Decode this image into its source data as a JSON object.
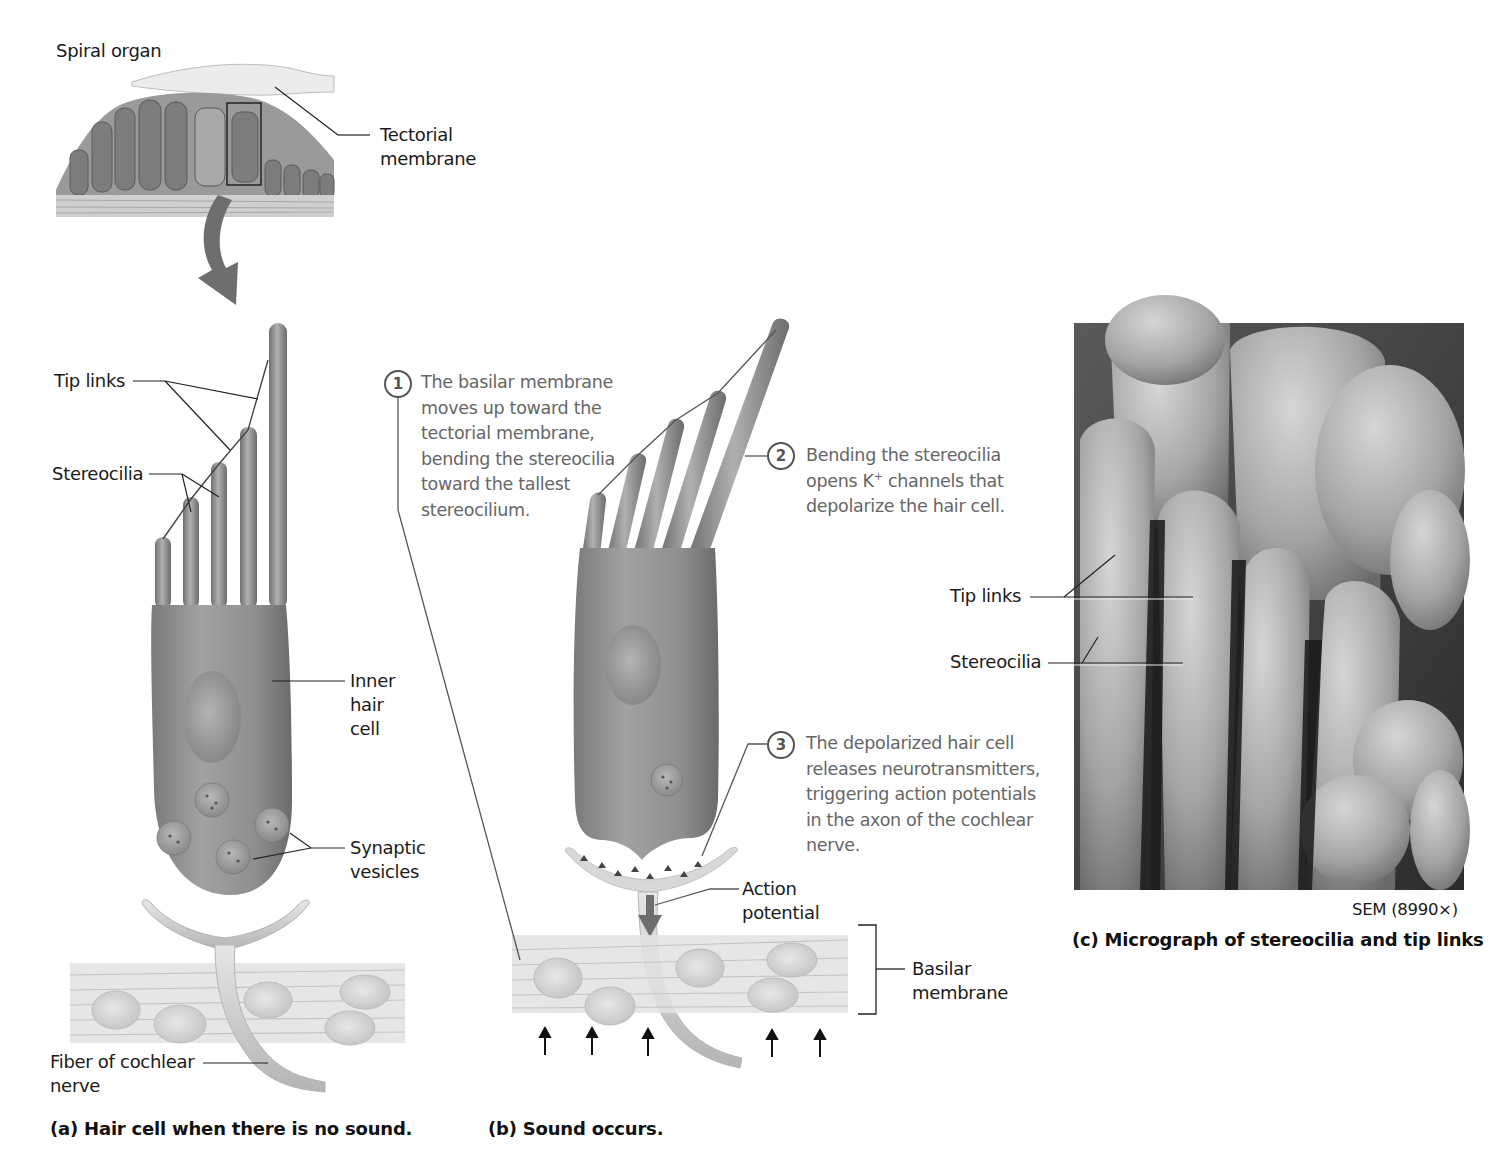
{
  "figure": {
    "inset": {
      "title": "Spiral organ",
      "tectorial_label_line1": "Tectorial",
      "tectorial_label_line2": "membrane"
    },
    "panel_a": {
      "tip_links_label": "Tip links",
      "stereocilia_label": "Stereocilia",
      "inner_hair_cell_line1": "Inner",
      "inner_hair_cell_line2": "hair",
      "inner_hair_cell_line3": "cell",
      "synaptic_vesicles_line1": "Synaptic",
      "synaptic_vesicles_line2": "vesicles",
      "fiber_line1": "Fiber of cochlear",
      "fiber_line2": "nerve",
      "caption": "(a) Hair cell when there is no sound."
    },
    "panel_b": {
      "steps": [
        {
          "number": "1",
          "lines": [
            "The basilar membrane",
            "moves up toward the",
            "tectorial membrane,",
            "bending the stereocilia",
            "toward the tallest",
            "stereocilium."
          ]
        },
        {
          "number": "2",
          "line1": "Bending the stereocilia",
          "line2_pre": "opens K",
          "line2_sup": "+",
          "line2_post": " channels that",
          "line3": "depolarize the hair cell."
        },
        {
          "number": "3",
          "lines": [
            "The depolarized hair cell",
            "releases neurotransmitters,",
            "triggering action potentials",
            "in the axon of the cochlear",
            "nerve."
          ]
        }
      ],
      "action_potential_line1": "Action",
      "action_potential_line2": "potential",
      "basilar_line1": "Basilar",
      "basilar_line2": "membrane",
      "caption": "(b) Sound occurs."
    },
    "panel_c": {
      "tip_links_label": "Tip links",
      "stereocilia_label": "Stereocilia",
      "magnification": "SEM (8990×)",
      "caption": "(c) Micrograph of stereocilia and tip links"
    }
  },
  "colors": {
    "cell_gray": "#8c8c8c",
    "cell_dark": "#6e6e6e",
    "membrane_light": "#d8d8d8",
    "text_gray": "#666666",
    "text_dark": "#1a1a1a"
  }
}
